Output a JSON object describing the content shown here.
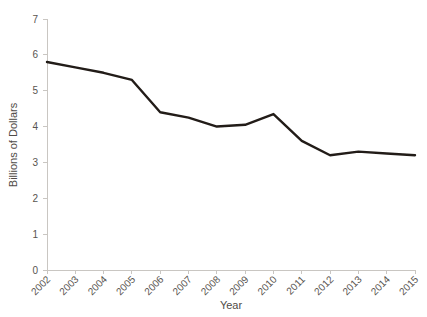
{
  "chart_data": {
    "type": "line",
    "title": "",
    "subtitle": "",
    "xlabel": "Year",
    "ylabel": "Billions of Dollars",
    "categories": [
      "2002",
      "2003",
      "2004",
      "2005",
      "2006",
      "2007",
      "2008",
      "2009",
      "2010",
      "2011",
      "2012",
      "2013",
      "2014",
      "2015"
    ],
    "x": [
      2002,
      2003,
      2004,
      2005,
      2006,
      2007,
      2008,
      2009,
      2010,
      2011,
      2012,
      2013,
      2014,
      2015
    ],
    "values": [
      5.8,
      5.65,
      5.5,
      5.3,
      4.4,
      4.25,
      4.0,
      4.05,
      4.35,
      3.6,
      3.2,
      3.3,
      3.25,
      3.2
    ],
    "series": [
      {
        "name": "Billions of Dollars",
        "values": [
          5.8,
          5.65,
          5.5,
          5.3,
          4.4,
          4.25,
          4.0,
          4.05,
          4.35,
          3.6,
          3.2,
          3.3,
          3.25,
          3.2
        ],
        "color": "#221c18"
      }
    ],
    "ylim": [
      0,
      7
    ],
    "xlim": [
      2002,
      2015
    ],
    "yticks": [
      0,
      1,
      2,
      3,
      4,
      5,
      6,
      7
    ],
    "ytick_labels": [
      "0",
      "1",
      "2",
      "3",
      "4",
      "5",
      "6",
      "7"
    ],
    "xtick_labels": [
      "2002",
      "2003",
      "2004",
      "2005",
      "2006",
      "2007",
      "2008",
      "2009",
      "2010",
      "2011",
      "2012",
      "2013",
      "2014",
      "2015"
    ],
    "grid": false,
    "legend": false,
    "legend_position": "none",
    "xtick_rotation": -45,
    "annotations": []
  },
  "colors": {
    "line": "#221c18",
    "axis": "#c9c6c2",
    "text": "#58544f",
    "background": "#ffffff"
  }
}
